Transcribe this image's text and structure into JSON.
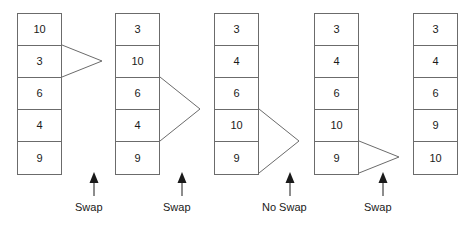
{
  "diagram": {
    "cell_width": 45,
    "cell_height": 32,
    "line_color": "#6b6b6b",
    "text_color": "#1a1a1a",
    "columns": [
      {
        "id": "state-1",
        "x": 17,
        "y": 13,
        "values": [
          "10",
          "3",
          "6",
          "4",
          "9"
        ],
        "bracket": {
          "from_row": 0,
          "to_row": 1,
          "depth": 40
        }
      },
      {
        "id": "state-2",
        "x": 115,
        "y": 13,
        "values": [
          "3",
          "10",
          "6",
          "4",
          "9"
        ],
        "bracket": {
          "from_row": 1,
          "to_row": 3,
          "depth": 40
        }
      },
      {
        "id": "state-3",
        "x": 214,
        "y": 13,
        "values": [
          "3",
          "4",
          "6",
          "10",
          "9"
        ],
        "bracket": {
          "from_row": 2,
          "to_row": 4,
          "depth": 40
        }
      },
      {
        "id": "state-4",
        "x": 314,
        "y": 13,
        "values": [
          "3",
          "4",
          "6",
          "10",
          "9"
        ],
        "bracket": {
          "from_row": 3,
          "to_row": 4,
          "depth": 40
        }
      },
      {
        "id": "state-5",
        "x": 413,
        "y": 13,
        "values": [
          "3",
          "4",
          "6",
          "9",
          "10"
        ],
        "bracket": null
      }
    ],
    "annotations": [
      {
        "id": "annotation-1",
        "label": "Swap",
        "arrow_x": 94,
        "arrow_top": 172,
        "arrow_bottom": 196,
        "label_x": 75,
        "label_y": 202
      },
      {
        "id": "annotation-2",
        "label": "Swap",
        "arrow_x": 182,
        "arrow_top": 172,
        "arrow_bottom": 196,
        "label_x": 163,
        "label_y": 202
      },
      {
        "id": "annotation-3",
        "label": "No Swap",
        "arrow_x": 290,
        "arrow_top": 172,
        "arrow_bottom": 196,
        "label_x": 262,
        "label_y": 202
      },
      {
        "id": "annotation-4",
        "label": "Swap",
        "arrow_x": 383,
        "arrow_top": 172,
        "arrow_bottom": 196,
        "label_x": 364,
        "label_y": 202
      }
    ]
  }
}
